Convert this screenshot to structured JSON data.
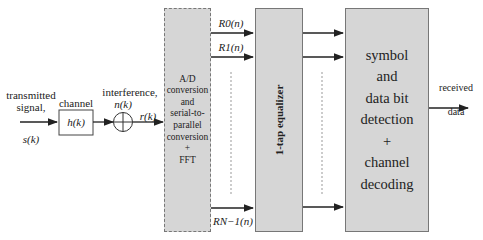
{
  "diagram": {
    "type": "block-diagram",
    "input": {
      "label_line1": "transmitted",
      "label_line2": "signal,",
      "symbol": "s(k)"
    },
    "channel": {
      "label": "channel",
      "symbol": "h(k)"
    },
    "interference": {
      "label": "interference,",
      "symbol": "n(k)",
      "output": "r(k)"
    },
    "fft_block": {
      "lines": [
        "A/D",
        "conversion",
        "and",
        "serial-to-",
        "parallel",
        "conversion",
        "+",
        "FFT"
      ]
    },
    "subcarriers": {
      "r0": "R0(n)",
      "r1": "R1(n)",
      "rn1": "RN−1(n)"
    },
    "equalizer": {
      "label": "1-tap equalizer"
    },
    "detection_block": {
      "lines": [
        "symbol",
        "and",
        "data bit",
        "detection",
        "+",
        "channel",
        "decoding"
      ]
    },
    "output": {
      "line1": "received",
      "line2": "data"
    }
  }
}
